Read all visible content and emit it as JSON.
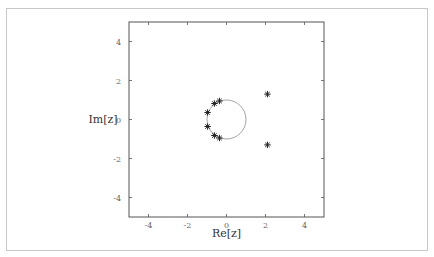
{
  "chart_data": {
    "type": "scatter",
    "title": "",
    "xlabel": "Re[z]",
    "ylabel": "Im[z]",
    "xlim": [
      -5,
      5
    ],
    "ylim": [
      -5,
      5
    ],
    "xticks": [
      "-4",
      "-2",
      "0",
      "2",
      "4"
    ],
    "yticks": [
      "4",
      "2",
      "0",
      "-2",
      "-4"
    ],
    "grid": false,
    "legend": null,
    "series": [
      {
        "name": "roots",
        "marker": "asterisk",
        "points": [
          {
            "x": -0.97,
            "y": 0.36
          },
          {
            "x": -0.97,
            "y": -0.36
          },
          {
            "x": -0.62,
            "y": 0.82
          },
          {
            "x": -0.62,
            "y": -0.82
          },
          {
            "x": -0.36,
            "y": 0.95
          },
          {
            "x": -0.36,
            "y": -0.95
          },
          {
            "x": 2.1,
            "y": 1.3
          },
          {
            "x": 2.1,
            "y": -1.3
          }
        ]
      }
    ],
    "annotations": [
      {
        "type": "circle",
        "center": [
          0,
          0
        ],
        "radius": 1,
        "description": "unit circle"
      }
    ]
  }
}
